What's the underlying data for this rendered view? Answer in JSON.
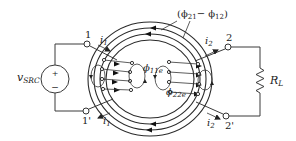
{
  "diagram": {
    "type": "coupled-inductor-toroid-circuit",
    "source": {
      "label_main": "v",
      "label_sub": "SRC",
      "plus": "+",
      "minus": "−"
    },
    "terminals": {
      "t1": "1",
      "t1p": "1'",
      "t2": "2",
      "t2p": "2'"
    },
    "currents": {
      "i1_top": {
        "main": "i",
        "sub": "1"
      },
      "i1_bottom": {
        "main": "i",
        "sub": "1"
      },
      "i2_top": {
        "main": "i",
        "sub": "2"
      },
      "i2_bottom": {
        "main": "i",
        "sub": "2"
      }
    },
    "load": {
      "label_main": "R",
      "label_sub": "L"
    },
    "flux_labels": {
      "mutual": {
        "open": "(",
        "phi1": "ϕ",
        "sub1": "21",
        "minus": "− ",
        "phi2": "ϕ",
        "sub2": "12",
        "close": ")"
      },
      "leak1": {
        "phi": "ϕ",
        "sub": "11e"
      },
      "leak2": {
        "phi": "ϕ",
        "sub": "22e"
      }
    },
    "colors": {
      "line": "#333333",
      "background": "#ffffff"
    }
  }
}
